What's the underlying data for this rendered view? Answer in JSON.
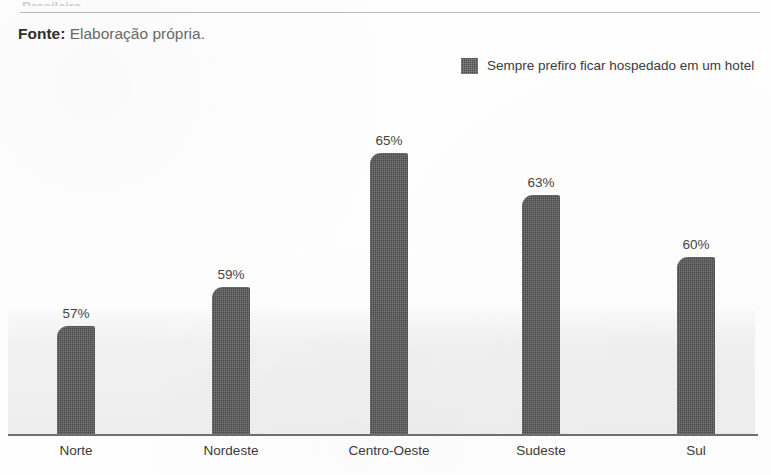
{
  "page": {
    "cropped_heading_text": "Brasileira",
    "caption_lead": "Fonte:",
    "caption_body": "Elaboração própria."
  },
  "legend": {
    "swatch_icon": "legend-swatch-icon",
    "label": "Sempre prefiro ficar hospedado em um hotel",
    "color": "#4d4d4d"
  },
  "chart_data": {
    "type": "bar",
    "title": "",
    "subtitle": "",
    "xlabel": "",
    "ylabel": "",
    "categories": [
      "Norte",
      "Nordeste",
      "Centro-Oeste",
      "Sudeste",
      "Sul"
    ],
    "values": [
      57,
      59,
      65,
      63,
      60
    ],
    "value_labels": [
      "57%",
      "59%",
      "65%",
      "63%",
      "60%"
    ],
    "series": [
      {
        "name": "Sempre prefiro ficar hospedado em um hotel",
        "values": [
          57,
          59,
          65,
          63,
          60
        ],
        "color": "#4a4a4a"
      }
    ],
    "ylim": [
      0,
      75
    ],
    "grid": false,
    "legend_position": "top-right",
    "units": "percent",
    "bar_color": "#4a4a4a",
    "axis_color": "#6f6f6f",
    "plot_band_color": "#eeeeee"
  }
}
